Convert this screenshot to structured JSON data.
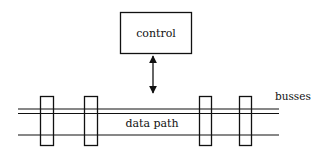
{
  "diagram": {
    "control_label": "control",
    "datapath_label": "data path",
    "busses_label": "busses",
    "colors": {
      "stroke": "#111111",
      "background": "#ffffff"
    },
    "registers_count": 4
  }
}
